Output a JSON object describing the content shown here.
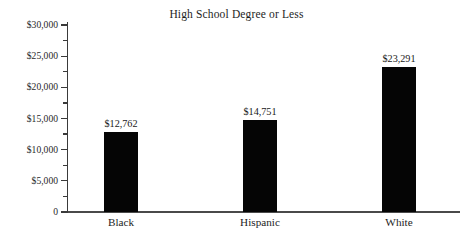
{
  "chart_data": {
    "type": "bar",
    "title": "High School Degree or Less",
    "xlabel": "",
    "ylabel": "",
    "categories": [
      "Black",
      "Hispanic",
      "White"
    ],
    "values": [
      12762,
      14751,
      23291
    ],
    "value_labels": [
      "$12,762",
      "$14,751",
      "$23,291"
    ],
    "ylim": [
      0,
      31000
    ],
    "ytick_values": [
      0,
      5000,
      10000,
      15000,
      20000,
      25000,
      30000
    ],
    "ytick_labels": [
      "0",
      "$5,000",
      "$10,000",
      "$15,000",
      "$20,000",
      "$25,000",
      "$30,000"
    ],
    "yminor_tick_values": [
      2500,
      7500,
      12500,
      17500,
      22500,
      27500
    ],
    "grid": false,
    "legend": false,
    "bar_color": "#050505",
    "axis_color": "#3a3a3a",
    "background_color": "#ffffff"
  }
}
